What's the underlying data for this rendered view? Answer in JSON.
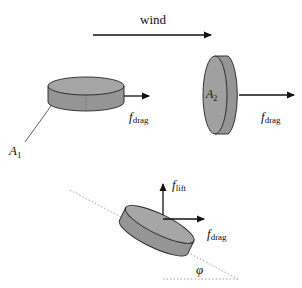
{
  "diagram": {
    "wind_label": "wind",
    "colors": {
      "disk_fill": "#9a9a9a",
      "disk_top": "#a8a8a8",
      "stroke": "#222222",
      "dashed": "#888888"
    },
    "disk_horizontal": {
      "area_label": "A",
      "area_sub": "1",
      "force_label": "f",
      "force_sub": "drag"
    },
    "disk_vertical": {
      "area_label": "A",
      "area_sub": "2",
      "force_label": "f",
      "force_sub": "drag"
    },
    "disk_tilted": {
      "lift_label": "f",
      "lift_sub": "lift",
      "drag_label": "f",
      "drag_sub": "drag",
      "angle_label": "φ"
    }
  }
}
